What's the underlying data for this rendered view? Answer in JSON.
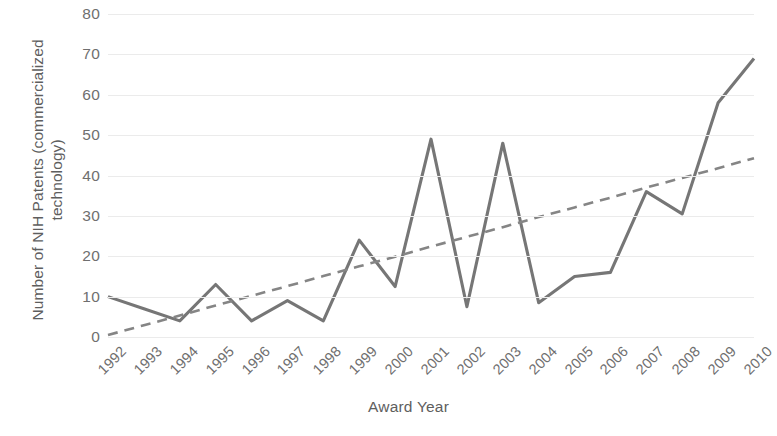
{
  "chart_data": {
    "type": "line",
    "title": "",
    "xlabel": "Award Year",
    "ylabel": "Number of NIH Patents (commercialized technology)",
    "ylabel_line1": "Number of NIH Patents (commercialized",
    "ylabel_line2": "technology)",
    "categories": [
      "1992",
      "1993",
      "1994",
      "1995",
      "1996",
      "1997",
      "1998",
      "1999",
      "2000",
      "2001",
      "2002",
      "2003",
      "2004",
      "2005",
      "2006",
      "2007",
      "2008",
      "2009",
      "2010"
    ],
    "series": [
      {
        "name": "NIH Patents",
        "style": "solid",
        "color": "#767676",
        "values": [
          10,
          7,
          4,
          13,
          4,
          9,
          4,
          24,
          12.5,
          49,
          7.5,
          48,
          8.5,
          15,
          16,
          36,
          30.5,
          58,
          69
        ]
      },
      {
        "name": "Linear trend",
        "style": "dashed",
        "color": "#858585",
        "values": [
          0.5,
          2.9,
          5.3,
          7.8,
          10.2,
          12.6,
          15.1,
          17.5,
          19.9,
          22.4,
          24.8,
          27.2,
          29.7,
          32.1,
          34.5,
          37.0,
          39.4,
          41.8,
          44.3
        ]
      }
    ],
    "yticks": [
      0,
      10,
      20,
      30,
      40,
      50,
      60,
      70,
      80
    ],
    "ylim": [
      0,
      80
    ],
    "grid": true,
    "legend": "none",
    "colors": {
      "line": "#767676",
      "trendline": "#858585",
      "gridline": "#ebebeb",
      "text": "#6f6f6f",
      "background": "#ffffff"
    }
  }
}
